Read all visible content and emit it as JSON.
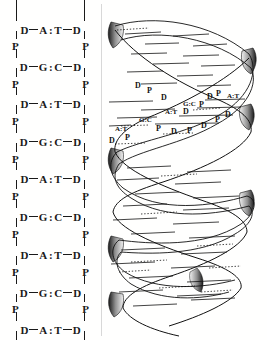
{
  "figure": {
    "background_color": "#fffffe",
    "ink_color": "#1a1a1a",
    "divider_color": "#d8d8d8"
  },
  "ladder": {
    "name": "dna-ladder-diagram",
    "sugar_label": "D",
    "phosphate_label": "P",
    "pair_separator": ":",
    "rows": [
      {
        "left_sugar": "D",
        "base_left": "A",
        "base_right": "T",
        "right_sugar": "D",
        "y": 22
      },
      {
        "left_sugar": "D",
        "base_left": "G",
        "base_right": "C",
        "right_sugar": "D",
        "y": 59
      },
      {
        "left_sugar": "D",
        "base_left": "A",
        "base_right": "T",
        "right_sugar": "D",
        "y": 96
      },
      {
        "left_sugar": "D",
        "base_left": "G",
        "base_right": "C",
        "right_sugar": "D",
        "y": 134
      },
      {
        "left_sugar": "D",
        "base_left": "A",
        "base_right": "T",
        "right_sugar": "D",
        "y": 171
      },
      {
        "left_sugar": "D",
        "base_left": "G",
        "base_right": "C",
        "right_sugar": "D",
        "y": 209
      },
      {
        "left_sugar": "D",
        "base_left": "A",
        "base_right": "T",
        "right_sugar": "D",
        "y": 247
      },
      {
        "left_sugar": "D",
        "base_left": "G",
        "base_right": "C",
        "right_sugar": "D",
        "y": 285
      },
      {
        "left_sugar": "D",
        "base_left": "A",
        "base_right": "T",
        "right_sugar": "D",
        "y": 322
      }
    ],
    "phosphates": [
      {
        "label": "P",
        "y": 40
      },
      {
        "label": "P",
        "y": 78
      },
      {
        "label": "P",
        "y": 115
      },
      {
        "label": "P",
        "y": 153
      },
      {
        "label": "P",
        "y": 190
      },
      {
        "label": "P",
        "y": 228
      },
      {
        "label": "P",
        "y": 266
      },
      {
        "label": "P",
        "y": 303
      }
    ]
  },
  "helix": {
    "name": "dna-double-helix-diagram",
    "labels": [
      {
        "text": "P",
        "x": 115,
        "y": 96
      },
      {
        "text": "D",
        "x": 106,
        "y": 99
      },
      {
        "text": "P",
        "x": 98,
        "y": 107
      },
      {
        "text": "D",
        "x": 82,
        "y": 114
      },
      {
        "text": "D",
        "x": 60,
        "y": 100
      },
      {
        "text": "P",
        "x": 46,
        "y": 93
      },
      {
        "text": "D",
        "x": 34,
        "y": 88
      },
      {
        "text": "A:T",
        "x": 126,
        "y": 98
      },
      {
        "text": "G:C",
        "x": 82,
        "y": 106
      },
      {
        "text": "A:T",
        "x": 64,
        "y": 114
      },
      {
        "text": "G:C",
        "x": 38,
        "y": 122
      },
      {
        "text": "A:T",
        "x": 14,
        "y": 131
      },
      {
        "text": "P",
        "x": 55,
        "y": 131
      },
      {
        "text": "D",
        "x": 70,
        "y": 134
      },
      {
        "text": "P",
        "x": 86,
        "y": 133
      },
      {
        "text": "D",
        "x": 100,
        "y": 128
      },
      {
        "text": "P",
        "x": 114,
        "y": 122
      },
      {
        "text": "D",
        "x": 124,
        "y": 117
      },
      {
        "text": "P",
        "x": 24,
        "y": 140
      },
      {
        "text": "D",
        "x": 8,
        "y": 143
      }
    ]
  }
}
